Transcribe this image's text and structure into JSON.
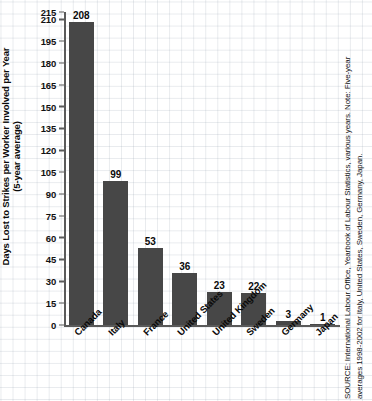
{
  "chart_data": {
    "type": "bar",
    "title": "",
    "xlabel": "",
    "ylabel": "Days Lost to Strikes per Worker Involved per Year (5-year average)",
    "ylabel_line1": "Days Lost to Strikes per Worker Involved per Year",
    "ylabel_line2": "(5-year average)",
    "categories": [
      "Canada",
      "Italy",
      "France",
      "United States",
      "United Kingdom",
      "Sweden",
      "Germany",
      "Japan"
    ],
    "values": [
      208,
      99,
      53,
      36,
      23,
      22,
      3,
      1
    ],
    "ylim": [
      0,
      215
    ],
    "yticks": [
      0,
      15,
      30,
      45,
      60,
      75,
      90,
      105,
      120,
      135,
      150,
      165,
      180,
      195,
      210,
      215
    ],
    "ytick_labels": [
      "0",
      "15",
      "30",
      "45",
      "60",
      "75",
      "90",
      "105",
      "120",
      "135",
      "150",
      "165",
      "180",
      "195",
      "210",
      "215"
    ],
    "grid": true,
    "legend": null,
    "bar_color": "#474747",
    "axis_color": "#5a5a5a",
    "grid_color": "#96a0af"
  },
  "source": {
    "line1": "SOURCE: International Labour Office, Yearbook of Labour Statistics, various years. Note: Five-year",
    "line2": "averages 1998-2002 for Italy, United States, Sweden, Germany, Japan."
  }
}
